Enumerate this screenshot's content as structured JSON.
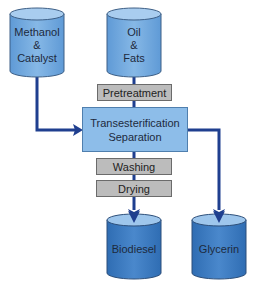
{
  "diagram": {
    "colors": {
      "line": "#1f3f8f",
      "cylinder_light": "#7fb3e3",
      "cylinder_dark": "#3f7fc4",
      "process_box": "#8dbde9",
      "step_box": "#bcbcbc"
    },
    "inputs": [
      {
        "id": "methanol",
        "lines": [
          "Methanol",
          "&",
          "Catalyst"
        ]
      },
      {
        "id": "oil",
        "lines": [
          "Oil",
          "&",
          "Fats"
        ]
      }
    ],
    "steps": {
      "pretreatment": "Pretreatment",
      "main_process": [
        "Transesterification",
        "Separation"
      ],
      "washing": "Washing",
      "drying": "Drying"
    },
    "outputs": [
      {
        "id": "biodiesel",
        "label": "Biodiesel"
      },
      {
        "id": "glycerin",
        "label": "Glycerin"
      }
    ],
    "edges": [
      {
        "from": "Methanol & Catalyst",
        "to": "Transesterification Separation"
      },
      {
        "from": "Oil & Fats",
        "to": "Pretreatment"
      },
      {
        "from": "Pretreatment",
        "to": "Transesterification Separation"
      },
      {
        "from": "Transesterification Separation",
        "to": "Washing"
      },
      {
        "from": "Washing",
        "to": "Drying"
      },
      {
        "from": "Drying",
        "to": "Biodiesel"
      },
      {
        "from": "Transesterification Separation",
        "to": "Glycerin"
      }
    ]
  }
}
